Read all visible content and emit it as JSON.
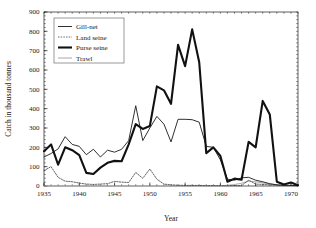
{
  "chart_data": {
    "type": "line",
    "title": "",
    "xlabel": "Year",
    "ylabel": "Catch in thousand tonnes",
    "xlim": [
      1935,
      1971
    ],
    "ylim": [
      0,
      900
    ],
    "xticks": [
      1935,
      1940,
      1945,
      1950,
      1955,
      1960,
      1965,
      1970
    ],
    "yticks": [
      0,
      100,
      200,
      300,
      400,
      500,
      600,
      700,
      800,
      900
    ],
    "grid": false,
    "legend_position": "top-left",
    "x": [
      1935,
      1936,
      1937,
      1938,
      1939,
      1940,
      1941,
      1942,
      1943,
      1944,
      1945,
      1946,
      1947,
      1948,
      1949,
      1950,
      1951,
      1952,
      1953,
      1954,
      1955,
      1956,
      1957,
      1958,
      1959,
      1960,
      1961,
      1962,
      1963,
      1964,
      1965,
      1966,
      1967,
      1968,
      1969,
      1970,
      1971
    ],
    "series": [
      {
        "name": "Gill-net",
        "style": "thin-solid",
        "color": "#1a1a1a",
        "values": [
          150,
          168,
          192,
          255,
          215,
          205,
          162,
          190,
          150,
          185,
          175,
          190,
          235,
          415,
          235,
          300,
          360,
          320,
          228,
          345,
          345,
          343,
          330,
          205,
          200,
          135,
          35,
          30,
          42,
          45,
          30,
          22,
          12,
          6,
          4,
          3,
          2
        ]
      },
      {
        "name": "Land seine",
        "style": "dotted",
        "color": "#3a3a3a",
        "values": [
          80,
          100,
          45,
          25,
          22,
          15,
          10,
          8,
          10,
          12,
          24,
          20,
          18,
          70,
          40,
          88,
          35,
          10,
          6,
          4,
          3,
          3,
          3,
          2,
          2,
          2,
          2,
          2,
          2,
          30,
          10,
          8,
          6,
          4,
          2,
          2,
          1
        ]
      },
      {
        "name": "Purse seine",
        "style": "thick-solid",
        "color": "#111111",
        "values": [
          180,
          215,
          110,
          200,
          185,
          160,
          68,
          62,
          95,
          120,
          130,
          128,
          215,
          320,
          295,
          310,
          515,
          495,
          425,
          730,
          620,
          810,
          640,
          170,
          200,
          155,
          22,
          38,
          32,
          228,
          200,
          440,
          370,
          22,
          8,
          18,
          4
        ]
      },
      {
        "name": "Trawl",
        "style": "light-solid",
        "color": "#b0b0b0",
        "values": [
          0,
          0,
          0,
          0,
          0,
          0,
          0,
          0,
          0,
          0,
          0,
          0,
          0,
          0,
          0,
          0,
          0,
          0,
          0,
          0,
          0,
          0,
          0,
          0,
          0,
          0,
          4,
          8,
          14,
          26,
          22,
          16,
          10,
          5,
          3,
          2,
          1
        ]
      }
    ]
  },
  "legend": {
    "items": [
      {
        "label": "Gill-net"
      },
      {
        "label": "Land seine"
      },
      {
        "label": "Purse seine"
      },
      {
        "label": "Trawl"
      }
    ]
  },
  "axes": {
    "x_title": "Year",
    "y_title": "Catch in thousand tonnes",
    "x_tick_labels": [
      "1935",
      "1940",
      "1945",
      "1950",
      "1955",
      "1960",
      "1965",
      "1970"
    ],
    "y_tick_labels": [
      "0",
      "100",
      "200",
      "300",
      "400",
      "500",
      "600",
      "700",
      "800",
      "900"
    ]
  },
  "colors": {
    "axis": "#1a1a1a",
    "gill_net": "#1a1a1a",
    "land_seine": "#3a3a3a",
    "purse_seine": "#111111",
    "trawl": "#b0b0b0",
    "background": "#ffffff"
  }
}
